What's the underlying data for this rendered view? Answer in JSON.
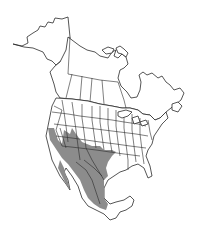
{
  "map": {
    "type": "species-range-map",
    "region": "North America",
    "background_color": "#ffffff",
    "outline_color": "#2a2a2a",
    "range_color": "#8c8c8c",
    "range_description": "Southwestern United States and most of Mexico",
    "range_areas": [
      "California",
      "Nevada (southern)",
      "Utah (southern)",
      "Arizona",
      "New Mexico",
      "Colorado (southern)",
      "Oklahoma (western)",
      "Texas",
      "Baja California",
      "Mainland Mexico (excluding Yucatan)"
    ],
    "legend": null,
    "labels": []
  }
}
